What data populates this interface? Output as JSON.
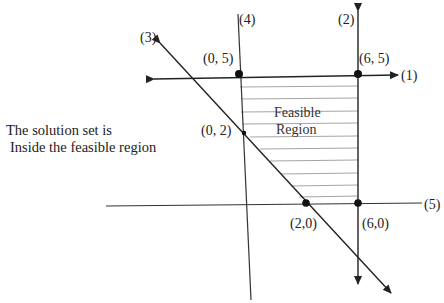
{
  "diagram": {
    "type": "linear-programming-feasible-region",
    "note": {
      "line1": "The solution set is",
      "line2": "Inside the feasible region"
    },
    "region_label": {
      "line1": "Feasible",
      "line2": "Region"
    },
    "constraint_labels": {
      "c1": "(1)",
      "c2": "(2)",
      "c3": "(3)",
      "c4": "(4)",
      "c5": "(5)"
    },
    "points": [
      {
        "label": "(0, 5)"
      },
      {
        "label": "(6, 5)"
      },
      {
        "label": "(0, 2)"
      },
      {
        "label": "(2,0)"
      },
      {
        "label": "(6,0)"
      }
    ],
    "colors": {
      "line": "#222222",
      "hatch": "#9a9a9a",
      "text": "#222222"
    }
  }
}
